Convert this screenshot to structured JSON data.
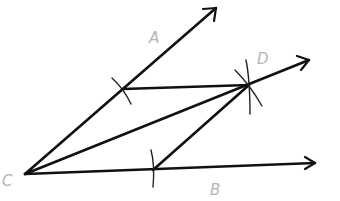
{
  "diagram": {
    "labels": {
      "A": "A",
      "B": "B",
      "C": "C",
      "D": "D"
    },
    "points": {
      "C": [
        25,
        174
      ],
      "A_tip": [
        217,
        7
      ],
      "D_tip": [
        310,
        59
      ],
      "B_tip": [
        316,
        163
      ],
      "P_on_CA": [
        123,
        89
      ],
      "D": [
        249,
        85
      ],
      "Q_on_CB": [
        153,
        170
      ]
    },
    "colors": {
      "line": "#111111",
      "label": "#b5b5b5",
      "background": "#ffffff"
    }
  }
}
